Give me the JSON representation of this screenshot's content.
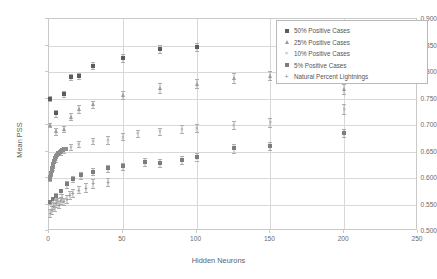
{
  "chart_data": {
    "type": "scatter",
    "title": "",
    "xlabel": "Hidden Neurons",
    "ylabel": "Mean PSS",
    "xlim": [
      0,
      250
    ],
    "ylim": [
      0.5,
      0.9
    ],
    "xticks": [
      "0",
      "50",
      "100",
      "150",
      "200",
      "250"
    ],
    "xtick_values": [
      0,
      50,
      100,
      150,
      200,
      250
    ],
    "yticks": [
      "0.500",
      "0.550",
      "0.600",
      "0.650",
      "0.700",
      "0.750",
      "0.800",
      "0.850",
      "0.900"
    ],
    "ytick_values": [
      0.5,
      0.55,
      0.6,
      0.65,
      0.7,
      0.75,
      0.8,
      0.85,
      0.9
    ],
    "grid": true,
    "legend_position": "top-right",
    "error_bars": true,
    "series": [
      {
        "name": "50% Positive Cases",
        "marker": "filled-square",
        "color": "#5c5c5c",
        "points": [
          {
            "x": 1,
            "y": 0.75,
            "err": 0.004
          },
          {
            "x": 5,
            "y": 0.722,
            "err": 0.006
          },
          {
            "x": 10,
            "y": 0.758,
            "err": 0.006
          },
          {
            "x": 15,
            "y": 0.791,
            "err": 0.006
          },
          {
            "x": 20,
            "y": 0.793,
            "err": 0.006
          },
          {
            "x": 30,
            "y": 0.812,
            "err": 0.006
          },
          {
            "x": 50,
            "y": 0.826,
            "err": 0.008
          },
          {
            "x": 75,
            "y": 0.843,
            "err": 0.008
          },
          {
            "x": 100,
            "y": 0.847,
            "err": 0.008
          }
        ]
      },
      {
        "name": "25% Positive Cases",
        "marker": "triangle",
        "color": "#9b9b9b",
        "points": [
          {
            "x": 1,
            "y": 0.7,
            "err": 0.004
          },
          {
            "x": 5,
            "y": 0.688,
            "err": 0.006
          },
          {
            "x": 10,
            "y": 0.692,
            "err": 0.006
          },
          {
            "x": 15,
            "y": 0.716,
            "err": 0.007
          },
          {
            "x": 20,
            "y": 0.73,
            "err": 0.007
          },
          {
            "x": 30,
            "y": 0.739,
            "err": 0.007
          },
          {
            "x": 50,
            "y": 0.757,
            "err": 0.008
          },
          {
            "x": 75,
            "y": 0.77,
            "err": 0.009
          },
          {
            "x": 100,
            "y": 0.778,
            "err": 0.009
          },
          {
            "x": 125,
            "y": 0.789,
            "err": 0.009
          },
          {
            "x": 150,
            "y": 0.793,
            "err": 0.009
          },
          {
            "x": 200,
            "y": 0.768,
            "err": 0.009
          }
        ]
      },
      {
        "name": "10% Positive Cases",
        "marker": "cross-x",
        "color": "#a8a8a8",
        "points": [
          {
            "x": 1,
            "y": 0.598,
            "err": 0.003
          },
          {
            "x": 3,
            "y": 0.62,
            "err": 0.004
          },
          {
            "x": 5,
            "y": 0.635,
            "err": 0.005
          },
          {
            "x": 8,
            "y": 0.648,
            "err": 0.005
          },
          {
            "x": 10,
            "y": 0.652,
            "err": 0.005
          },
          {
            "x": 15,
            "y": 0.658,
            "err": 0.006
          },
          {
            "x": 20,
            "y": 0.664,
            "err": 0.006
          },
          {
            "x": 30,
            "y": 0.67,
            "err": 0.006
          },
          {
            "x": 40,
            "y": 0.672,
            "err": 0.007
          },
          {
            "x": 50,
            "y": 0.678,
            "err": 0.007
          },
          {
            "x": 60,
            "y": 0.684,
            "err": 0.007
          },
          {
            "x": 75,
            "y": 0.688,
            "err": 0.007
          },
          {
            "x": 90,
            "y": 0.692,
            "err": 0.008
          },
          {
            "x": 100,
            "y": 0.694,
            "err": 0.008
          },
          {
            "x": 125,
            "y": 0.7,
            "err": 0.008
          },
          {
            "x": 150,
            "y": 0.705,
            "err": 0.008
          },
          {
            "x": 200,
            "y": 0.73,
            "err": 0.009
          }
        ]
      },
      {
        "name": "5% Positive Cases",
        "marker": "filled-diamond",
        "color": "#7d7d7d",
        "points": [
          {
            "x": 1,
            "y": 0.555,
            "err": 0.004
          },
          {
            "x": 3,
            "y": 0.56,
            "err": 0.005
          },
          {
            "x": 5,
            "y": 0.566,
            "err": 0.005
          },
          {
            "x": 8,
            "y": 0.575,
            "err": 0.005
          },
          {
            "x": 12,
            "y": 0.588,
            "err": 0.006
          },
          {
            "x": 16,
            "y": 0.598,
            "err": 0.006
          },
          {
            "x": 22,
            "y": 0.605,
            "err": 0.006
          },
          {
            "x": 30,
            "y": 0.612,
            "err": 0.006
          },
          {
            "x": 40,
            "y": 0.618,
            "err": 0.007
          },
          {
            "x": 50,
            "y": 0.622,
            "err": 0.007
          },
          {
            "x": 65,
            "y": 0.63,
            "err": 0.007
          },
          {
            "x": 75,
            "y": 0.628,
            "err": 0.007
          },
          {
            "x": 90,
            "y": 0.634,
            "err": 0.007
          },
          {
            "x": 100,
            "y": 0.64,
            "err": 0.007
          },
          {
            "x": 125,
            "y": 0.656,
            "err": 0.008
          },
          {
            "x": 150,
            "y": 0.66,
            "err": 0.008
          },
          {
            "x": 200,
            "y": 0.685,
            "err": 0.008
          }
        ]
      },
      {
        "name": "Natural Percent Lightnings",
        "marker": "plus",
        "color": "#8a8a8a",
        "points": [
          {
            "x": 1,
            "y": 0.534,
            "err": 0.007
          },
          {
            "x": 2,
            "y": 0.54,
            "err": 0.007
          },
          {
            "x": 3,
            "y": 0.548,
            "err": 0.007
          },
          {
            "x": 4,
            "y": 0.545,
            "err": 0.007
          },
          {
            "x": 5,
            "y": 0.552,
            "err": 0.007
          },
          {
            "x": 6,
            "y": 0.556,
            "err": 0.007
          },
          {
            "x": 7,
            "y": 0.55,
            "err": 0.007
          },
          {
            "x": 8,
            "y": 0.558,
            "err": 0.007
          },
          {
            "x": 9,
            "y": 0.562,
            "err": 0.007
          },
          {
            "x": 10,
            "y": 0.556,
            "err": 0.007
          },
          {
            "x": 12,
            "y": 0.56,
            "err": 0.007
          },
          {
            "x": 14,
            "y": 0.568,
            "err": 0.007
          },
          {
            "x": 16,
            "y": 0.572,
            "err": 0.007
          },
          {
            "x": 20,
            "y": 0.578,
            "err": 0.007
          },
          {
            "x": 25,
            "y": 0.582,
            "err": 0.008
          },
          {
            "x": 30,
            "y": 0.59,
            "err": 0.008
          },
          {
            "x": 40,
            "y": 0.592,
            "err": 0.008
          }
        ]
      }
    ],
    "ramp_series": {
      "name": "dense-low-n-ramp",
      "color": "#8d8d8d",
      "points": [
        {
          "x": 0.6,
          "y": 0.598
        },
        {
          "x": 0.9,
          "y": 0.602
        },
        {
          "x": 1.2,
          "y": 0.606
        },
        {
          "x": 1.5,
          "y": 0.61
        },
        {
          "x": 1.8,
          "y": 0.614
        },
        {
          "x": 2.1,
          "y": 0.618
        },
        {
          "x": 2.4,
          "y": 0.621
        },
        {
          "x": 2.7,
          "y": 0.624
        },
        {
          "x": 3.0,
          "y": 0.627
        },
        {
          "x": 3.3,
          "y": 0.63
        },
        {
          "x": 3.6,
          "y": 0.632
        },
        {
          "x": 3.9,
          "y": 0.635
        },
        {
          "x": 4.2,
          "y": 0.637
        },
        {
          "x": 4.6,
          "y": 0.639
        },
        {
          "x": 5.0,
          "y": 0.641
        },
        {
          "x": 5.4,
          "y": 0.643
        },
        {
          "x": 5.8,
          "y": 0.645
        },
        {
          "x": 6.3,
          "y": 0.647
        },
        {
          "x": 6.8,
          "y": 0.648
        },
        {
          "x": 7.4,
          "y": 0.65
        },
        {
          "x": 8.0,
          "y": 0.651
        },
        {
          "x": 8.7,
          "y": 0.652
        },
        {
          "x": 9.5,
          "y": 0.653
        },
        {
          "x": 10.5,
          "y": 0.654
        },
        {
          "x": 11.5,
          "y": 0.655
        }
      ]
    }
  },
  "legend": {
    "entries": [
      {
        "label": "50% Positive Cases",
        "marker": "filled-square"
      },
      {
        "label": "25% Positive Cases",
        "marker": "triangle"
      },
      {
        "label": "10% Positive Cases",
        "marker": "cross-x"
      },
      {
        "label": "5% Positive Cases",
        "marker": "filled-diamond"
      },
      {
        "label": "Natural Percent Lightnings",
        "marker": "plus"
      }
    ]
  }
}
